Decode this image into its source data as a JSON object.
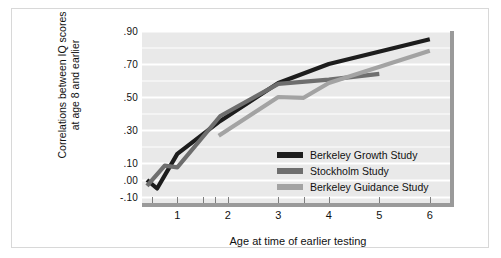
{
  "chart_data": {
    "type": "line",
    "title": "",
    "xlabel": "Age at time of earlier testing",
    "ylabel": "Correlations between IQ scores at age 8 and earlier",
    "ylabel_line1": "Correlations between IQ scores",
    "ylabel_line2": "at age 8 and earlier",
    "xlim": [
      0.3,
      6.4
    ],
    "ylim": [
      -0.1,
      0.9
    ],
    "grid": true,
    "grid_orientation": "horizontal",
    "legend_position": "inside-lower-right",
    "ytick_labels": [
      ".90",
      ".70",
      ".50",
      ".30",
      ".10",
      ".00",
      "-.10"
    ],
    "ytick_values": [
      0.9,
      0.7,
      0.5,
      0.3,
      0.1,
      0.0,
      -0.1
    ],
    "xtick_labels": [
      "1",
      "2",
      "3",
      "4",
      "5",
      "6"
    ],
    "xtick_values": [
      1,
      2,
      3,
      4,
      5,
      6
    ],
    "xminor_ticks": [
      0.5,
      1.0,
      1.5,
      1.75,
      2.0,
      3.0,
      3.5,
      4.0,
      5.0
    ],
    "series": [
      {
        "name": "Berkeley Growth Study",
        "color": "#1d1d1d",
        "points": [
          {
            "x": 0.4,
            "y": 0.0
          },
          {
            "x": 0.6,
            "y": -0.05
          },
          {
            "x": 1.0,
            "y": 0.155
          },
          {
            "x": 1.85,
            "y": 0.355
          },
          {
            "x": 3.0,
            "y": 0.585
          },
          {
            "x": 4.0,
            "y": 0.7
          },
          {
            "x": 6.0,
            "y": 0.85
          }
        ]
      },
      {
        "name": "Stockholm Study",
        "color": "#6e6e6e",
        "points": [
          {
            "x": 0.4,
            "y": -0.035
          },
          {
            "x": 0.75,
            "y": 0.085
          },
          {
            "x": 1.0,
            "y": 0.075
          },
          {
            "x": 1.85,
            "y": 0.385
          },
          {
            "x": 3.0,
            "y": 0.58
          },
          {
            "x": 4.0,
            "y": 0.605
          },
          {
            "x": 5.0,
            "y": 0.64
          }
        ]
      },
      {
        "name": "Berkeley Guidance Study",
        "color": "#a3a3a3",
        "points": [
          {
            "x": 1.82,
            "y": 0.265
          },
          {
            "x": 3.0,
            "y": 0.5
          },
          {
            "x": 3.5,
            "y": 0.495
          },
          {
            "x": 4.0,
            "y": 0.585
          },
          {
            "x": 6.0,
            "y": 0.78
          }
        ]
      }
    ]
  },
  "legend": {
    "entries": [
      {
        "label": "Berkeley Growth Study",
        "color": "#1d1d1d"
      },
      {
        "label": "Stockholm Study",
        "color": "#6e6e6e"
      },
      {
        "label": "Berkeley Guidance Study",
        "color": "#a3a3a3"
      }
    ]
  },
  "colors": {
    "plot_background": "#e9e9e9",
    "gridline": "#ffffff",
    "axis_rule": "#9a9a9a",
    "frame": "#d8d8d8",
    "text": "#111111"
  }
}
